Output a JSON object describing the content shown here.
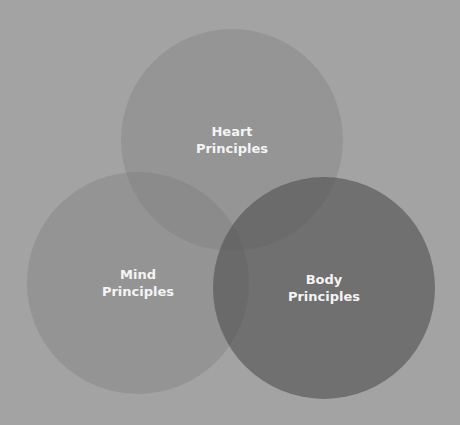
{
  "diagram": {
    "type": "venn",
    "background": "#a3a3a3",
    "circles": [
      {
        "id": "heart",
        "line1": "Heart",
        "line2": "Principles",
        "cx": 232,
        "cy": 140,
        "r": 111,
        "fill": "rgba(120,120,120,0.30)"
      },
      {
        "id": "mind",
        "line1": "Mind",
        "line2": "Principles",
        "cx": 138,
        "cy": 283,
        "r": 111,
        "fill": "rgba(120,120,120,0.35)"
      },
      {
        "id": "body",
        "line1": "Body",
        "line2": "Principles",
        "cx": 324,
        "cy": 288,
        "r": 111,
        "fill": "rgba(80,80,80,0.62)"
      }
    ]
  }
}
